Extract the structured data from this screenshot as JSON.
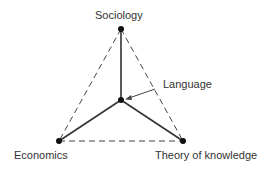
{
  "diagram": {
    "type": "tetrahedron-concept-diagram",
    "nodes": {
      "top": {
        "label": "Sociology"
      },
      "center": {
        "label": "Language"
      },
      "left": {
        "label": "Economics"
      },
      "right": {
        "label": "Theory of knowledge"
      }
    },
    "edges": {
      "solid": [
        [
          "center",
          "top"
        ],
        [
          "center",
          "left"
        ],
        [
          "center",
          "right"
        ]
      ],
      "dashed": [
        [
          "top",
          "left"
        ],
        [
          "top",
          "right"
        ],
        [
          "left",
          "right"
        ]
      ]
    },
    "colors": {
      "line": "#333333",
      "node": "#111111"
    }
  }
}
